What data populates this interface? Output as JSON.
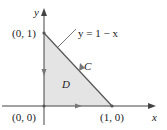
{
  "diagram": {
    "axes": {
      "x_label": "x",
      "y_label": "y"
    },
    "points": [
      {
        "label": "(0, 1)",
        "x": 0,
        "y": 1
      },
      {
        "label": "(0, 0)",
        "x": 0,
        "y": 0
      },
      {
        "label": "(1, 0)",
        "x": 1,
        "y": 0
      }
    ],
    "curve_label": "y = 1 − x",
    "path_label": "C",
    "region_label": "D",
    "colors": {
      "region_fill": "#e4e4e4",
      "line": "#555555",
      "arrow": "#777777"
    }
  }
}
